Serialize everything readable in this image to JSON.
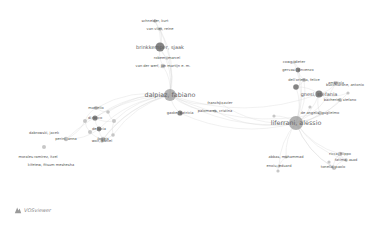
{
  "app": "VOSviewer",
  "logo": {
    "label": "VOSviewer",
    "icon": "vosviewer-logo-icon"
  },
  "colors": {
    "edge": "#d6d6d6",
    "node_dark": "#6e6e6e",
    "node_mid": "#9a9a9a",
    "node_light": "#bdbdbd",
    "label": "#555555"
  },
  "nodes": [
    {
      "id": "dalpiaz",
      "label": "dalpiaz, fabiano",
      "x": 170,
      "y": 95,
      "r": 6,
      "size": "big"
    },
    {
      "id": "aferrani",
      "label": "liferrani, alessio",
      "x": 296,
      "y": 123,
      "r": 7,
      "size": "big"
    },
    {
      "id": "brinkkemper",
      "label": "brinkkemper, sjaak",
      "x": 160,
      "y": 47,
      "r": 4.5,
      "size": "mid"
    },
    {
      "id": "schneider",
      "label": "schneider, kurt",
      "x": 155,
      "y": 21,
      "r": 1.8,
      "size": "small"
    },
    {
      "id": "vanvliet",
      "label": "van vliet, reine",
      "x": 160,
      "y": 29,
      "r": 1.8,
      "size": "small"
    },
    {
      "id": "robeer",
      "label": "robeer, marcel",
      "x": 167,
      "y": 58,
      "r": 1.6,
      "size": "small"
    },
    {
      "id": "vanderwerf",
      "label": "van der werf, jan martijn e. m.",
      "x": 163,
      "y": 66,
      "r": 2.2,
      "size": "small"
    },
    {
      "id": "gaoke",
      "label": "gaoke, patricia",
      "x": 180,
      "y": 113,
      "r": 2.6,
      "size": "small"
    },
    {
      "id": "franch",
      "label": "franch, xavier",
      "x": 220,
      "y": 103,
      "r": 1.4,
      "size": "small"
    },
    {
      "id": "palomares",
      "label": "palomares, cristina",
      "x": 215,
      "y": 111,
      "r": 1.6,
      "size": "small"
    },
    {
      "id": "marcello",
      "label": "marcello",
      "x": 96,
      "y": 108,
      "r": 2,
      "size": "small"
    },
    {
      "id": "dc1",
      "label": "di rocco",
      "x": 95,
      "y": 118,
      "r": 2.6,
      "size": "small"
    },
    {
      "id": "dc2",
      "label": "de lucia",
      "x": 99,
      "y": 129,
      "r": 2.4,
      "size": "small"
    },
    {
      "id": "dc3",
      "label": "foggia",
      "x": 103,
      "y": 139,
      "r": 2.2,
      "size": "small"
    },
    {
      "id": "dc4",
      "label": "",
      "x": 85,
      "y": 121,
      "r": 2,
      "size": "small"
    },
    {
      "id": "dc5",
      "label": "",
      "x": 114,
      "y": 121,
      "r": 2,
      "size": "small"
    },
    {
      "id": "dc6",
      "label": "",
      "x": 90,
      "y": 132,
      "r": 2,
      "size": "small"
    },
    {
      "id": "dc7",
      "label": "",
      "x": 113,
      "y": 135,
      "r": 1.8,
      "size": "small"
    },
    {
      "id": "dc8",
      "label": "",
      "x": 108,
      "y": 112,
      "r": 1.8,
      "size": "small"
    },
    {
      "id": "wolf",
      "label": "wolf, daniel",
      "x": 102,
      "y": 141,
      "r": 1.8,
      "size": "small"
    },
    {
      "id": "dabrowski",
      "label": "dabrowski, jacek",
      "x": 44,
      "y": 133,
      "r": 0,
      "size": "small"
    },
    {
      "id": "perini",
      "label": "perini, anna",
      "x": 66,
      "y": 139,
      "r": 2.2,
      "size": "small"
    },
    {
      "id": "loose",
      "label": "",
      "x": 44,
      "y": 147,
      "r": 2,
      "size": "small"
    },
    {
      "id": "morales",
      "label": "morales-ramirez, itzel",
      "x": 38,
      "y": 157,
      "r": 0,
      "size": "small"
    },
    {
      "id": "kifetew",
      "label": "kifetew, fitsum meshesha",
      "x": 51,
      "y": 165,
      "r": 0,
      "size": "small"
    },
    {
      "id": "cowg",
      "label": "cowg, dieter",
      "x": 294,
      "y": 62,
      "r": 1.6,
      "size": "small"
    },
    {
      "id": "gervasi",
      "label": "gervasi, vincenzo",
      "x": 298,
      "y": 70,
      "r": 2.4,
      "size": "small"
    },
    {
      "id": "dellorletta",
      "label": "dell'orletta, felice",
      "x": 304,
      "y": 80,
      "r": 2,
      "size": "small"
    },
    {
      "id": "r1",
      "label": "",
      "x": 296,
      "y": 87,
      "r": 2.8,
      "size": "small"
    },
    {
      "id": "gnesi",
      "label": "gnesi, stefania",
      "x": 319,
      "y": 94,
      "r": 3.6,
      "size": "mid"
    },
    {
      "id": "ambriola",
      "label": "ambriola",
      "x": 336,
      "y": 83,
      "r": 2,
      "size": "small"
    },
    {
      "id": "bucchiarone",
      "label": "bucchiarone, antonio",
      "x": 345,
      "y": 85,
      "r": 0,
      "size": "small"
    },
    {
      "id": "rosadini",
      "label": "bacherini, stefano",
      "x": 340,
      "y": 100,
      "r": 2,
      "size": "small"
    },
    {
      "id": "r2",
      "label": "",
      "x": 348,
      "y": 93,
      "r": 1.6,
      "size": "small"
    },
    {
      "id": "deangelis",
      "label": "de angelis, guglielmo",
      "x": 320,
      "y": 113,
      "r": 2,
      "size": "small"
    },
    {
      "id": "r3",
      "label": "",
      "x": 310,
      "y": 107,
      "r": 1.6,
      "size": "small"
    },
    {
      "id": "r4",
      "label": "",
      "x": 274,
      "y": 116,
      "r": 1.6,
      "size": "small"
    },
    {
      "id": "abbas",
      "label": "abbas, muhammad",
      "x": 286,
      "y": 157,
      "r": 1.6,
      "size": "small"
    },
    {
      "id": "enoiu",
      "label": "enoiu, eduard",
      "x": 279,
      "y": 166,
      "r": 1.6,
      "size": "small"
    },
    {
      "id": "r5",
      "label": "",
      "x": 278,
      "y": 171,
      "r": 1.6,
      "size": "small"
    },
    {
      "id": "ricca",
      "label": "ricca, filippo",
      "x": 340,
      "y": 154,
      "r": 2.2,
      "size": "small"
    },
    {
      "id": "fatima",
      "label": "fatima, asad",
      "x": 346,
      "y": 160,
      "r": 1.8,
      "size": "small"
    },
    {
      "id": "tonella",
      "label": "tonella, paolo",
      "x": 333,
      "y": 167,
      "r": 1.8,
      "size": "small"
    },
    {
      "id": "r6",
      "label": "",
      "x": 329,
      "y": 162,
      "r": 1.6,
      "size": "small"
    },
    {
      "id": "r7",
      "label": "",
      "x": 334,
      "y": 168,
      "r": 2,
      "size": "small"
    }
  ],
  "edges": [
    [
      "dalpiaz",
      "aferrani"
    ],
    [
      "dalpiaz",
      "brinkkemper"
    ],
    [
      "dalpiaz",
      "schneider"
    ],
    [
      "dalpiaz",
      "vanvliet"
    ],
    [
      "dalpiaz",
      "vanderwerf"
    ],
    [
      "dalpiaz",
      "robeer"
    ],
    [
      "dalpiaz",
      "gaoke"
    ],
    [
      "brinkkemper",
      "schneider"
    ],
    [
      "brinkkemper",
      "vanvliet"
    ],
    [
      "brinkkemper",
      "vanderwerf"
    ],
    [
      "brinkkemper",
      "robeer"
    ],
    [
      "dalpiaz",
      "marcello"
    ],
    [
      "dalpiaz",
      "dc1"
    ],
    [
      "dalpiaz",
      "dc2"
    ],
    [
      "dalpiaz",
      "dc3"
    ],
    [
      "dalpiaz",
      "dc5"
    ],
    [
      "dalpiaz",
      "dc8"
    ],
    [
      "dalpiaz",
      "dc7"
    ],
    [
      "dalpiaz",
      "perini"
    ],
    [
      "dalpiaz",
      "wolf"
    ],
    [
      "dc1",
      "dc2"
    ],
    [
      "dc2",
      "dc3"
    ],
    [
      "dc1",
      "dc4"
    ],
    [
      "dc4",
      "dc6"
    ],
    [
      "dc6",
      "dc3"
    ],
    [
      "dc5",
      "dc7"
    ],
    [
      "dc8",
      "dc5"
    ],
    [
      "marcello",
      "dc8"
    ],
    [
      "dc1",
      "dc5"
    ],
    [
      "dc2",
      "dc6"
    ],
    [
      "dc3",
      "dc7"
    ],
    [
      "marcello",
      "dc4"
    ],
    [
      "perini",
      "dc2"
    ],
    [
      "perini",
      "dc4"
    ],
    [
      "dalpiaz",
      "franch"
    ],
    [
      "dalpiaz",
      "palomares"
    ],
    [
      "palomares",
      "aferrani"
    ],
    [
      "franch",
      "aferrani"
    ],
    [
      "gaoke",
      "aferrani"
    ],
    [
      "aferrani",
      "gnesi"
    ],
    [
      "aferrani",
      "gervasi"
    ],
    [
      "aferrani",
      "dellorletta"
    ],
    [
      "aferrani",
      "r1"
    ],
    [
      "aferrani",
      "deangelis"
    ],
    [
      "aferrani",
      "r3"
    ],
    [
      "aferrani",
      "rosadini"
    ],
    [
      "aferrani",
      "ambriola"
    ],
    [
      "aferrani",
      "r2"
    ],
    [
      "aferrani",
      "cowg"
    ],
    [
      "aferrani",
      "r4"
    ],
    [
      "aferrani",
      "abbas"
    ],
    [
      "aferrani",
      "enoiu"
    ],
    [
      "aferrani",
      "ricca"
    ],
    [
      "aferrani",
      "fatima"
    ],
    [
      "aferrani",
      "tonella"
    ],
    [
      "aferrani",
      "r7"
    ],
    [
      "gnesi",
      "ambriola"
    ],
    [
      "gnesi",
      "rosadini"
    ],
    [
      "gnesi",
      "r2"
    ],
    [
      "gnesi",
      "r1"
    ],
    [
      "gnesi",
      "deangelis"
    ],
    [
      "gervasi",
      "dellorletta"
    ],
    [
      "gervasi",
      "cowg"
    ],
    [
      "r1",
      "dellorletta"
    ],
    [
      "ricca",
      "tonella"
    ],
    [
      "ricca",
      "fatima"
    ],
    [
      "fatima",
      "r7"
    ],
    [
      "r6",
      "r7"
    ],
    [
      "abbas",
      "enoiu"
    ],
    [
      "enoiu",
      "r5"
    ],
    [
      "dalpiaz",
      "gnesi"
    ],
    [
      "dalpiaz",
      "deangelis"
    ]
  ]
}
